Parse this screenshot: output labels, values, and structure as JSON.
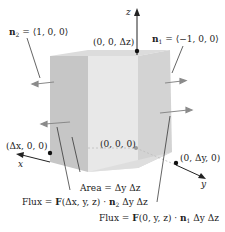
{
  "figure": {
    "axes": {
      "x_label": "x",
      "y_label": "y",
      "z_label": "z"
    },
    "normals": {
      "n2": {
        "symbol": "n",
        "sub": "2",
        "value": "= ⟨1, 0, 0⟩"
      },
      "n1": {
        "symbol": "n",
        "sub": "1",
        "value": "= ⟨−1, 0, 0⟩"
      }
    },
    "points": {
      "top": "(0, 0, Δz)",
      "origin": "(0, 0, 0)",
      "x_corner": "(Δx, 0, 0)",
      "y_corner": "(0, Δy, 0)"
    },
    "annotations": {
      "area": "Area = Δy Δz",
      "flux_front": {
        "pre": "Flux = ",
        "F": "F",
        "args": "(Δx, y, z) · ",
        "n": "n",
        "sub": "2",
        "post": " Δy Δz"
      },
      "flux_back": {
        "pre": "Flux = ",
        "F": "F",
        "args": "(0, y, z) · ",
        "n": "n",
        "sub": "1",
        "post": " Δy Δz"
      }
    },
    "colors": {
      "front_face": "#c9c9c9",
      "mid_face": "#e6e6e6",
      "right_face": "#d2d2d2",
      "top_face": "#dcdcdc",
      "arrow": "#8a8a8a",
      "point": "#111111"
    }
  }
}
